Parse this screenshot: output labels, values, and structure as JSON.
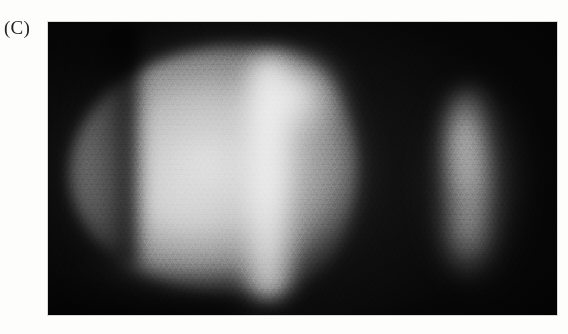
{
  "figure": {
    "panel_label": "(C)",
    "caption": "",
    "modality": "grayscale fluorescence micrograph",
    "background_color": "#fdfdfc"
  },
  "micrograph": {
    "field_color": "#040404",
    "frame": {
      "x": 48,
      "y": 22,
      "width": 509,
      "height": 293
    },
    "objects": [
      {
        "name": "embryo-body",
        "description": "large ovoid embryo, rounded anterior at left, truncated posterior at right, honeycomb cellular surface texture",
        "bounds": {
          "x": 22,
          "y": 24,
          "width": 288,
          "height": 248
        },
        "peak_brightness": "#eaeaea",
        "mean_brightness": "#b0b0b0"
      },
      {
        "name": "embryo-bright-band",
        "description": "bright vertical stripe of signal through the mid-posterior region",
        "bounds": {
          "x": 190,
          "y": 34,
          "width": 62,
          "height": 242
        },
        "peak_brightness": "#e8e8e8"
      },
      {
        "name": "posterior-fragment",
        "description": "smaller, dimmer crescent-shaped fragment to the right of the embryo",
        "bounds": {
          "x": 386,
          "y": 66,
          "width": 74,
          "height": 196
        },
        "peak_brightness": "#c4c4c4",
        "mean_brightness": "#6e6e6e"
      }
    ],
    "gap": {
      "name": "dark-gap",
      "description": "dark background separating the embryo from the fragment",
      "x_range": [
        310,
        386
      ]
    }
  }
}
